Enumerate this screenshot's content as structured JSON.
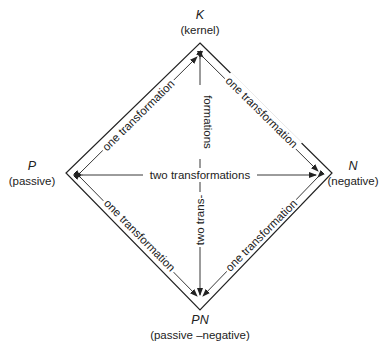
{
  "diagram": {
    "type": "transformation-diamond",
    "vertices": {
      "top": {
        "symbol": "K",
        "name": "(kernel)"
      },
      "left": {
        "symbol": "P",
        "name": "(passive)"
      },
      "right": {
        "symbol": "N",
        "name": "(negative)"
      },
      "bottom": {
        "symbol": "PN",
        "name": "(passive –negative)"
      }
    },
    "edges": {
      "top_left": "one transformation",
      "top_right": "one transformation",
      "bottom_left": "one transformation",
      "bottom_right": "one transformation",
      "horizontal": "two transformations",
      "vertical_part1": "two trans-",
      "vertical_part2": "formations"
    },
    "colors": {
      "line": "#222222",
      "background": "#ffffff"
    }
  }
}
